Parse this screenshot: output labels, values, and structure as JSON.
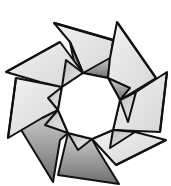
{
  "image": {
    "subject": "origami ring illustration",
    "description": "Eight-unit modular origami ring (octagonal star wreath) drawn in black ink with gray stippled shading",
    "units": 8,
    "colors": {
      "background": "#ffffff",
      "outline": "#111111",
      "light_fill": "#e6e6e6",
      "mid_fill": "#c4c4c4",
      "dark_fill": "#8a8a8a",
      "hole": "#ffffff"
    }
  }
}
